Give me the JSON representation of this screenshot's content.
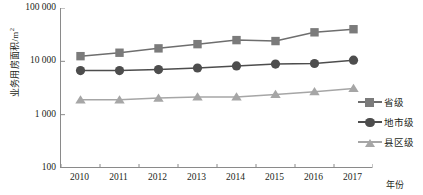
{
  "chart_data": {
    "type": "line",
    "title": "",
    "xlabel": "年份",
    "ylabel": "业务用房面积/m",
    "ylabel_sup": "2",
    "categories": [
      "2010",
      "2011",
      "2012",
      "2013",
      "2014",
      "2015",
      "2016",
      "2017"
    ],
    "yscale": "log",
    "ylim": [
      100,
      100000
    ],
    "yticks": [
      "100 000",
      "10 000",
      "1 000",
      "100"
    ],
    "ytick_values": [
      100000,
      10000,
      1000,
      100
    ],
    "grid": false,
    "legend_position": "right",
    "series": [
      {
        "name": "省级",
        "marker": "square",
        "color": "#7b7b7b",
        "line_color": "#6e6e6e",
        "values": [
          12500,
          14500,
          17500,
          21000,
          25000,
          24000,
          35000,
          40000
        ]
      },
      {
        "name": "地市级",
        "marker": "circle",
        "color": "#4d4d4d",
        "line_color": "#4d4d4d",
        "values": [
          6700,
          6700,
          7000,
          7500,
          8200,
          8900,
          9100,
          10500
        ]
      },
      {
        "name": "县区级",
        "marker": "triangle",
        "color": "#a6a6a6",
        "line_color": "#a6a6a6",
        "values": [
          1900,
          1900,
          2050,
          2150,
          2150,
          2400,
          2700,
          3100
        ]
      }
    ]
  },
  "axis": {
    "frame_color": "#8a8a8a"
  }
}
